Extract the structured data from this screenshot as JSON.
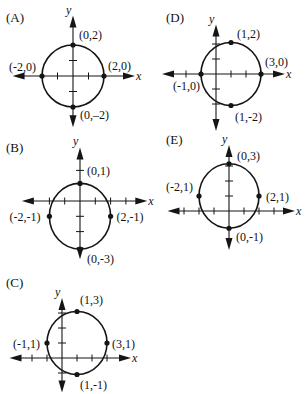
{
  "figure": {
    "stroke_color": "#151515",
    "axis_labels": {
      "x": "x",
      "y": "y"
    }
  },
  "graphs": [
    {
      "id": "A",
      "label": "(A)",
      "label_pos": [
        6,
        22
      ],
      "origin": [
        73,
        76
      ],
      "unit": 15.5,
      "center": [
        0,
        0
      ],
      "radius_x": 2,
      "radius_y": 2,
      "x_ticks": [
        -1,
        1
      ],
      "y_ticks": [
        -1,
        1
      ],
      "x_axis_extent": [
        -3.9,
        4.0
      ],
      "y_axis_extent": [
        -3.3,
        3.9
      ],
      "points": [
        {
          "coord": [
            0,
            2
          ],
          "label": "(0,2)",
          "dx": 6,
          "dy": -6
        },
        {
          "coord": [
            -2,
            0
          ],
          "label": "(-2,0)",
          "dx": -33,
          "dy": -5
        },
        {
          "coord": [
            2,
            0
          ],
          "label": "(2,0)",
          "dx": 4,
          "dy": -6
        },
        {
          "coord": [
            0,
            -2
          ],
          "label": "(0,–2)",
          "dx": 7,
          "dy": 12
        }
      ]
    },
    {
      "id": "D",
      "label": "(D)",
      "label_pos": [
        166,
        22
      ],
      "origin": [
        216,
        74
      ],
      "unit": 15,
      "center": [
        1,
        0
      ],
      "radius_x": 2,
      "radius_y": 2.1,
      "x_ticks": [
        -2,
        -1,
        1,
        2,
        3
      ],
      "y_ticks": [
        -2,
        -1,
        1,
        2
      ],
      "x_axis_extent": [
        -3.6,
        4.6
      ],
      "y_axis_extent": [
        -3.8,
        3.3
      ],
      "points": [
        {
          "coord": [
            1,
            2
          ],
          "label": "(1,2)",
          "dx": 6,
          "dy": -5
        },
        {
          "coord": [
            -1,
            0
          ],
          "label": "(-1,0)",
          "dx": -28,
          "dy": 16
        },
        {
          "coord": [
            3,
            0
          ],
          "label": "(3,0)",
          "dx": 4,
          "dy": -8
        },
        {
          "coord": [
            1,
            -2
          ],
          "label": "(1,-2)",
          "dx": 4,
          "dy": 15
        }
      ]
    },
    {
      "id": "B",
      "label": "(B)",
      "label_pos": [
        6,
        152
      ],
      "origin": [
        80,
        201
      ],
      "unit": 15.3,
      "center": [
        0,
        -1
      ],
      "radius_x": 2,
      "radius_y": 2.15,
      "x_ticks": [
        -2,
        -1,
        1,
        2,
        3
      ],
      "y_ticks": [
        2,
        -1,
        -2
      ],
      "x_axis_extent": [
        -3.8,
        4.4
      ],
      "y_axis_extent": [
        -3.8,
        3.5
      ],
      "points": [
        {
          "coord": [
            0,
            1
          ],
          "label": "(0,1)",
          "dx": 7,
          "dy": -8
        },
        {
          "coord": [
            -2,
            -1
          ],
          "label": "(-2,-1)",
          "dx": -40,
          "dy": 5
        },
        {
          "coord": [
            2,
            -1
          ],
          "label": "(2,-1)",
          "dx": 6,
          "dy": 5
        },
        {
          "coord": [
            0,
            -3
          ],
          "label": "(0,-3)",
          "dx": 7,
          "dy": 14
        }
      ]
    },
    {
      "id": "E",
      "label": "(E)",
      "label_pos": [
        166,
        144
      ],
      "origin": [
        229,
        211
      ],
      "unit": 15,
      "center": [
        0,
        1
      ],
      "radius_x": 2,
      "radius_y": 2.15,
      "x_ticks": [
        -3,
        -2,
        -1,
        1,
        2,
        3
      ],
      "y_ticks": [
        1,
        2,
        3
      ],
      "x_axis_extent": [
        -4.1,
        4.4
      ],
      "y_axis_extent": [
        -2.6,
        4.4
      ],
      "points": [
        {
          "coord": [
            0,
            3
          ],
          "label": "(0,3)",
          "dx": 8,
          "dy": -4
        },
        {
          "coord": [
            -2,
            1
          ],
          "label": "(-2,1)",
          "dx": -33,
          "dy": -5
        },
        {
          "coord": [
            2,
            1
          ],
          "label": "(2,1)",
          "dx": 7,
          "dy": 5
        },
        {
          "coord": [
            0,
            -1
          ],
          "label": "(0,-1)",
          "dx": 7,
          "dy": 13
        }
      ]
    },
    {
      "id": "C",
      "label": "(C)",
      "label_pos": [
        6,
        287
      ],
      "origin": [
        62,
        358
      ],
      "unit": 15,
      "center": [
        1,
        1
      ],
      "radius_x": 2,
      "radius_y": 2.1,
      "x_ticks": [
        -2,
        -1,
        1,
        2,
        3
      ],
      "y_ticks": [
        -1,
        1,
        2,
        3
      ],
      "x_axis_extent": [
        -3.5,
        4.6
      ],
      "y_axis_extent": [
        -2.3,
        4.0
      ],
      "points": [
        {
          "coord": [
            1,
            3
          ],
          "label": "(1,3)",
          "dx": 3,
          "dy": -8
        },
        {
          "coord": [
            -1,
            1
          ],
          "label": "(-1,1)",
          "dx": -34,
          "dy": 5
        },
        {
          "coord": [
            3,
            1
          ],
          "label": "(3,1)",
          "dx": 5,
          "dy": 5
        },
        {
          "coord": [
            1,
            -1
          ],
          "label": "(1,-1)",
          "dx": 3,
          "dy": 14
        }
      ]
    }
  ]
}
